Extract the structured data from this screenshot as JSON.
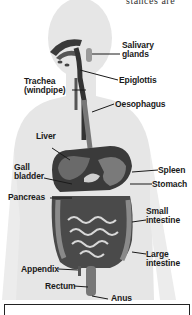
{
  "diagram": {
    "top_cut_text": "stances are",
    "labels": {
      "salivary_glands": [
        "Salivary",
        "glands"
      ],
      "epiglottis": "Epiglottis",
      "trachea": [
        "Trachea",
        "(windpipe)"
      ],
      "oesophagus": "Oesophagus",
      "liver": "Liver",
      "gall_bladder": [
        "Gall",
        "bladder"
      ],
      "spleen": "Spleen",
      "stomach": "Stomach",
      "pancreas": "Pancreas",
      "small_intestine": [
        "Small",
        "intestine"
      ],
      "large_intestine": [
        "Large",
        "intestine"
      ],
      "appendix": "Appendix",
      "rectum": "Rectum",
      "anus": "Anus"
    },
    "colors": {
      "body": "#e4e4e4",
      "organ_dark": "#2e2e2e",
      "organ_mid": "#6a6a6a",
      "text": "#1a1a1a"
    }
  }
}
